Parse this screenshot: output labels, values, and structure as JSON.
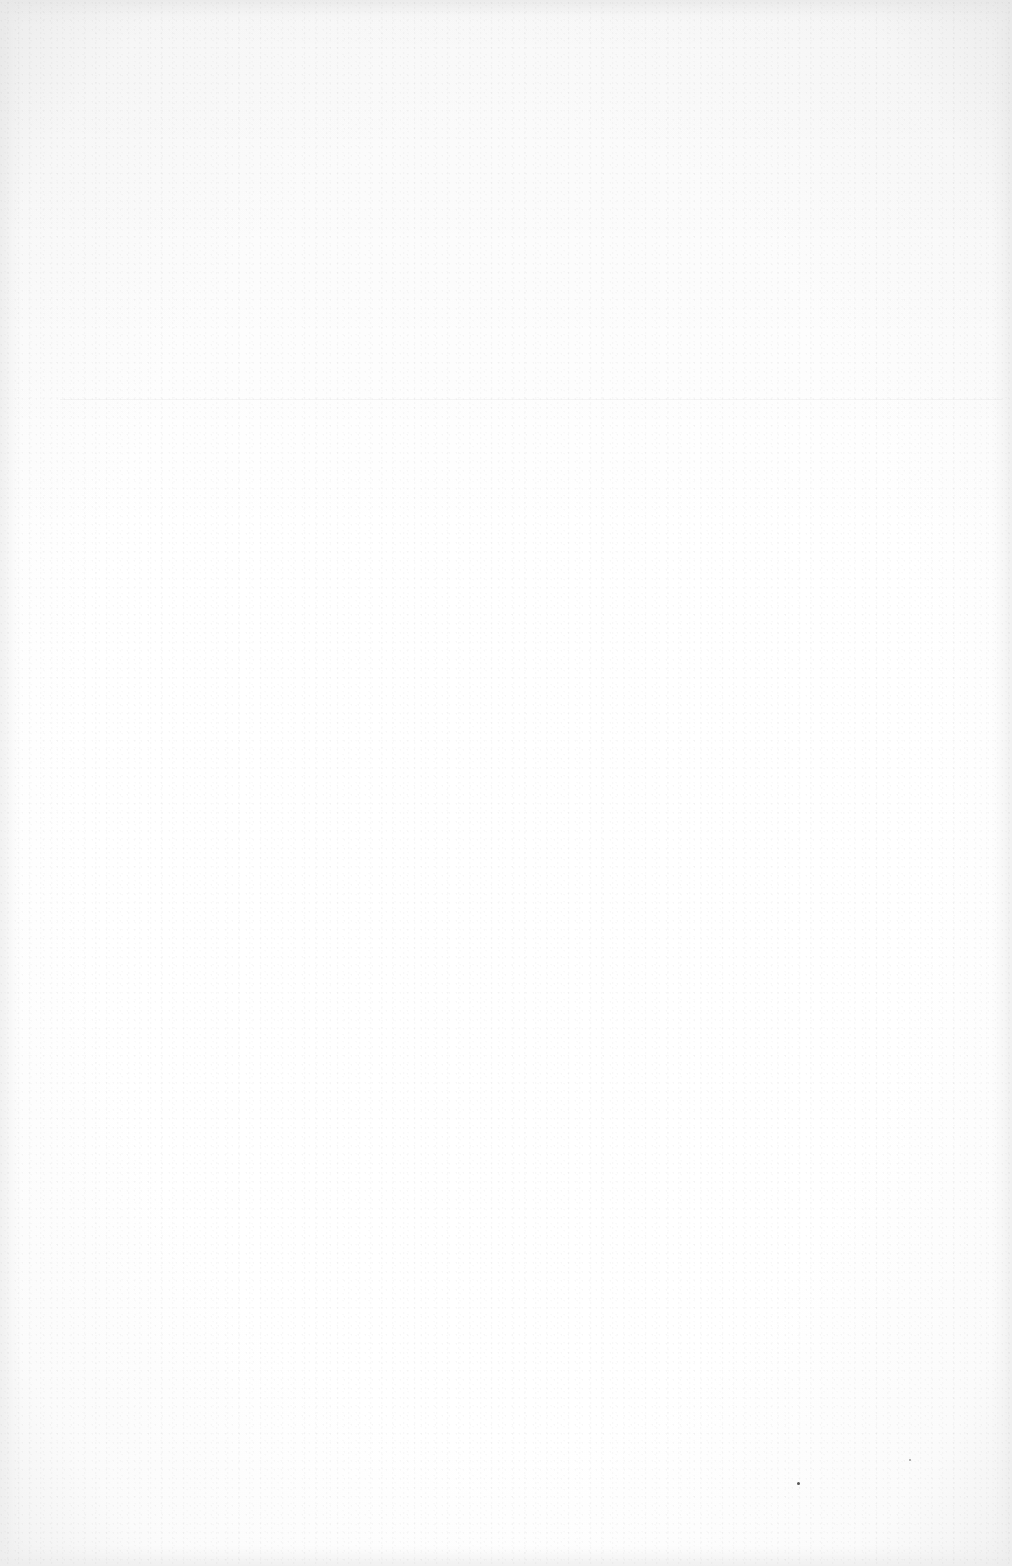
{
  "document": {
    "type": "scanned-page",
    "content": "",
    "is_blank": true,
    "colors": {
      "paper": "#ffffff",
      "edge_shadow": "#ececec"
    }
  }
}
